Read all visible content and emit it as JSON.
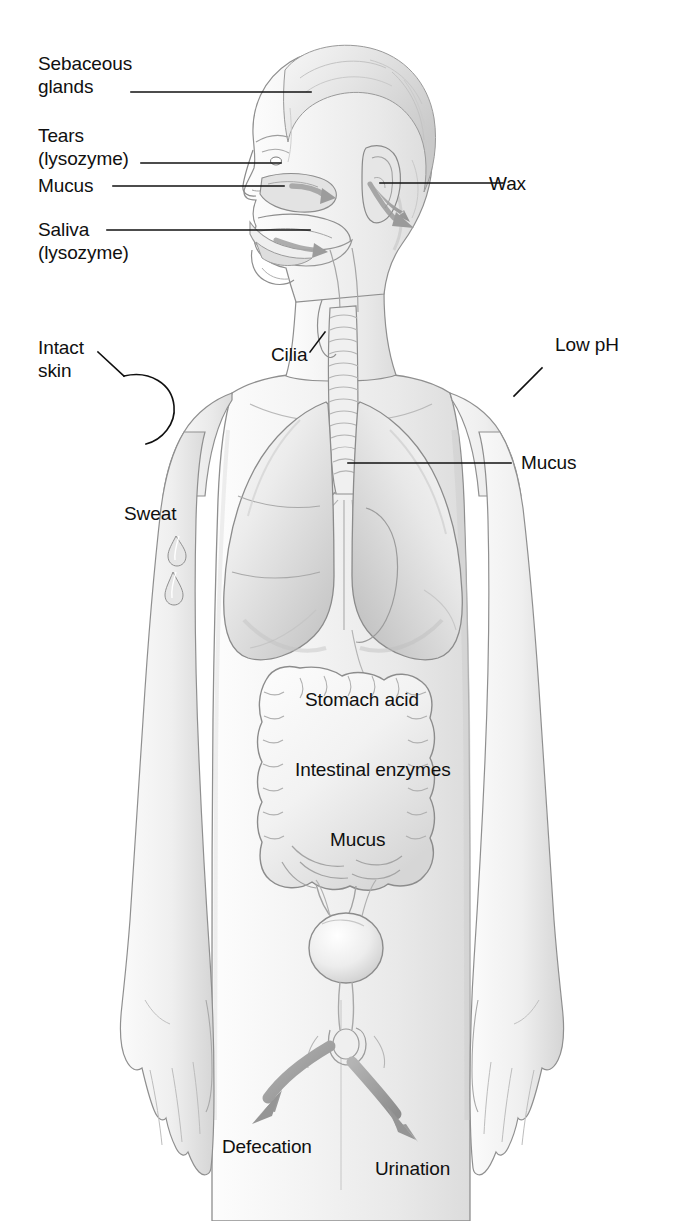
{
  "figure": {
    "background_color": "#ffffff",
    "body_fill_color": "#f2f2f2",
    "body_shade_color": "#d8d8d8",
    "outline_color": "#8a8a8a",
    "leader_line_color": "#101010",
    "arrow_color": "#9a9a9a",
    "text_color": "#101010"
  },
  "labels": {
    "sebaceous_glands": {
      "line1": "Sebaceous",
      "line2": "glands"
    },
    "tears": {
      "line1": "Tears",
      "line2": "(lysozyme)"
    },
    "mucus_nose": "Mucus",
    "saliva": {
      "line1": "Saliva",
      "line2": "(lysozyme)"
    },
    "intact_skin": {
      "line1": "Intact",
      "line2": "skin"
    },
    "sweat": "Sweat",
    "cilia": "Cilia",
    "wax": "Wax",
    "low_ph": "Low pH",
    "mucus_lungs": "Mucus",
    "stomach_acid": "Stomach acid",
    "intestinal_enzymes": "Intestinal enzymes",
    "mucus_intestine": "Mucus",
    "defecation": "Defecation",
    "urination": "Urination"
  },
  "anatomy_parts": [
    "head-hair",
    "face-profile",
    "nasal-cavity",
    "oral-cavity",
    "tongue",
    "ear",
    "neck",
    "trachea",
    "left-lung",
    "right-lung",
    "bronchi",
    "torso",
    "large-intestine",
    "small-intestine",
    "bladder",
    "urethra",
    "arms",
    "hands",
    "thighs"
  ],
  "arrows": [
    {
      "name": "ear-wax-arrow",
      "direction": "out-of-ear"
    },
    {
      "name": "nasal-mucus-arrow",
      "direction": "down-back"
    },
    {
      "name": "oral-saliva-arrow",
      "direction": "down-back"
    },
    {
      "name": "defecation-arrow",
      "direction": "down-left"
    },
    {
      "name": "urination-arrow",
      "direction": "down-right"
    }
  ]
}
